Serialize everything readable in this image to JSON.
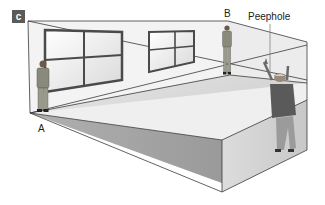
{
  "figure": {
    "panel_label": "c",
    "labels": {
      "point_a": "A",
      "point_b": "B",
      "peephole": "Peephole"
    },
    "colors": {
      "panel_badge": "#5a5a5a",
      "wall_light": "#f2f2f2",
      "wall_mid": "#d8d8d8",
      "wall_dark": "#a8a8a8",
      "outline": "#3a3a3a",
      "window_frame": "#4a4a4a"
    }
  }
}
